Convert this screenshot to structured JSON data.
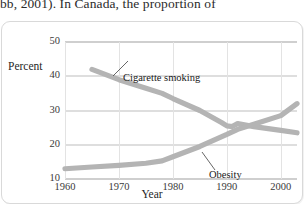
{
  "page": {
    "body_text_fragment": "bb, 2001). In Canada, the proportion of"
  },
  "figure": {
    "y_axis_title": "Percent",
    "x_axis_title": "Year",
    "y_ticks": [
      "50",
      "40",
      "30",
      "20",
      "10"
    ],
    "x_ticks": [
      "1960",
      "1970",
      "1980",
      "1990",
      "2000"
    ],
    "annotations": {
      "smoking": "Cigarette smoking",
      "obesity": "Obesity"
    },
    "colors": {
      "series_line": "#b3b3b3",
      "grid": "#dedede",
      "frame": "#d9d9d9",
      "text": "#1f1f1f"
    }
  },
  "chart_data": {
    "type": "line",
    "title": "",
    "subtitle": "",
    "xlabel": "Year",
    "ylabel": "Percent",
    "xlim": [
      1960,
      2003
    ],
    "ylim": [
      10,
      50
    ],
    "y_ticks": [
      10,
      20,
      30,
      40,
      50
    ],
    "x_ticks": [
      1960,
      1970,
      1980,
      1990,
      2000
    ],
    "grid": true,
    "legend": "none (direct annotations on lines)",
    "annotations": [
      {
        "text": "Cigarette smoking",
        "points_to_year": 1972,
        "points_to_value": 37.5
      },
      {
        "text": "Obesity",
        "points_to_year": 1986,
        "points_to_value": 21.5
      }
    ],
    "series": [
      {
        "name": "Cigarette smoking",
        "x": [
          1965,
          1970,
          1975,
          1978,
          1980,
          1985,
          1989,
          1990,
          1991,
          1992,
          1995,
          2000,
          2003
        ],
        "values": [
          42.0,
          39.0,
          36.5,
          35.0,
          33.5,
          30.0,
          26.5,
          25.5,
          25.3,
          26.2,
          25.3,
          24.2,
          23.5
        ]
      },
      {
        "name": "Obesity",
        "x": [
          1960,
          1965,
          1970,
          1975,
          1978,
          1980,
          1985,
          1990,
          1992,
          1995,
          2000,
          2003
        ],
        "values": [
          13.0,
          13.5,
          14.0,
          14.6,
          15.3,
          16.5,
          19.5,
          23.0,
          24.5,
          26.0,
          28.5,
          32.0
        ]
      }
    ]
  }
}
